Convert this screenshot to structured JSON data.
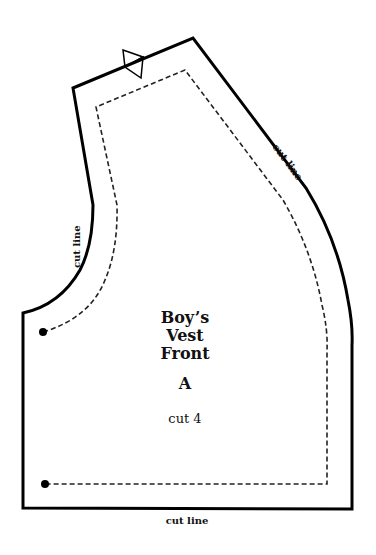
{
  "pattern": {
    "title_lines": [
      "Boy’s",
      "Vest",
      "Front"
    ],
    "piece_letter": "A",
    "cut_instruction": "cut 4",
    "cut_line_labels": {
      "armhole": "cut line",
      "shoulder_side": "cut line",
      "bottom": "cut line"
    },
    "markers": [
      "notch-triangle",
      "dot-start",
      "dot-end"
    ],
    "colors": {
      "outline": "#000000",
      "seam": "#222222",
      "background": "#ffffff"
    }
  }
}
